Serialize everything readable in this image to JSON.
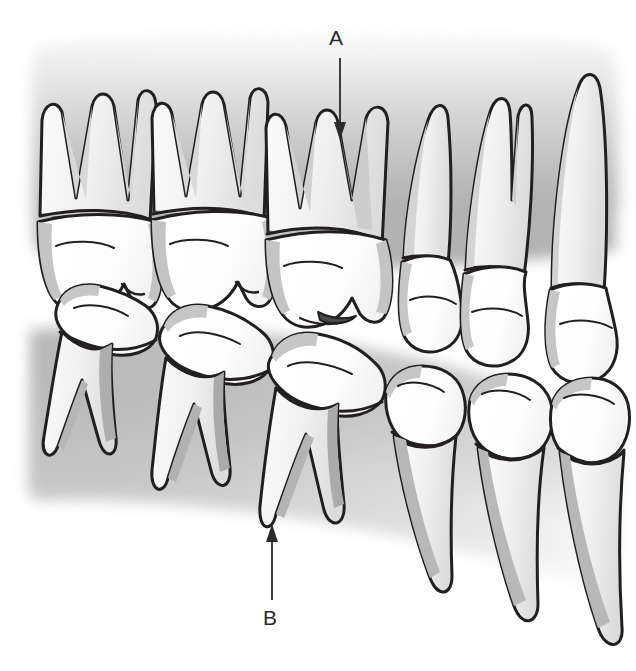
{
  "figure": {
    "style": "grayscale medical line illustration",
    "colors": {
      "outline": "#231f20",
      "enamel": "#ffffff",
      "root_light": "#f2f2f2",
      "root_shade": "#cfcfcf",
      "crown_shade": "#c9c9c9",
      "bone_light": "#e9e9e9",
      "bone_mid": "#c6c6c6",
      "bone_dark": "#a9a9a9",
      "background": "#ffffff",
      "label_text": "#2b2b2b"
    }
  },
  "annotations": [
    {
      "id": "a",
      "label": "A",
      "arrow_direction": "down",
      "points_to": "root of upper (maxillary) molar",
      "label_x": 338,
      "label_y": 40,
      "arrow_from_x": 340,
      "arrow_from_y": 58,
      "arrow_to_x": 340,
      "arrow_to_y": 137
    },
    {
      "id": "b",
      "label": "B",
      "arrow_direction": "up",
      "points_to": "root apex of lower (mandibular) molar",
      "label_x": 272,
      "label_y": 620,
      "arrow_from_x": 272,
      "arrow_from_y": 600,
      "arrow_to_x": 272,
      "arrow_to_y": 524
    }
  ],
  "arches": {
    "upper": {
      "name": "maxillary arch",
      "teeth": [
        {
          "position": 1,
          "type": "molar",
          "roots": 3,
          "label": "upper molar"
        },
        {
          "position": 2,
          "type": "molar",
          "roots": 3,
          "label": "upper molar"
        },
        {
          "position": 3,
          "type": "molar",
          "roots": 3,
          "label": "upper molar"
        },
        {
          "position": 4,
          "type": "premolar",
          "roots": 1,
          "label": "upper premolar"
        },
        {
          "position": 5,
          "type": "premolar",
          "roots": 2,
          "label": "upper premolar"
        },
        {
          "position": 6,
          "type": "canine",
          "roots": 1,
          "label": "upper canine"
        }
      ]
    },
    "lower": {
      "name": "mandibular arch",
      "teeth": [
        {
          "position": 1,
          "type": "molar",
          "roots": 2,
          "label": "lower molar"
        },
        {
          "position": 2,
          "type": "molar",
          "roots": 2,
          "label": "lower molar"
        },
        {
          "position": 3,
          "type": "molar",
          "roots": 2,
          "label": "lower molar"
        },
        {
          "position": 4,
          "type": "premolar",
          "roots": 1,
          "label": "lower premolar"
        },
        {
          "position": 5,
          "type": "premolar",
          "roots": 1,
          "label": "lower premolar"
        },
        {
          "position": 6,
          "type": "canine",
          "roots": 1,
          "label": "lower canine"
        }
      ]
    }
  }
}
